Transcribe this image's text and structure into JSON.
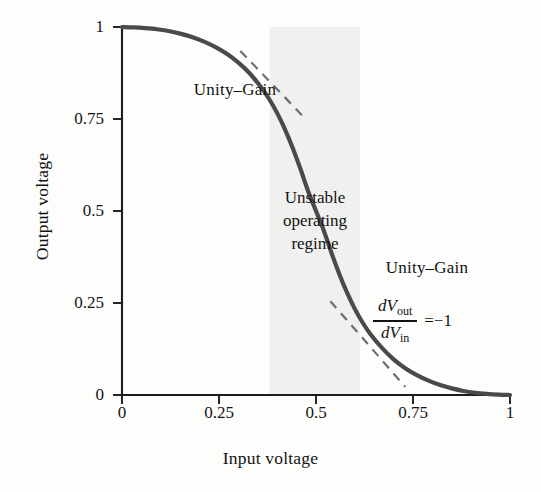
{
  "chart_data": {
    "type": "line",
    "title": "",
    "xlabel": "Input voltage",
    "ylabel": "Output voltage",
    "xlim": [
      0,
      1
    ],
    "ylim": [
      0,
      1
    ],
    "grid": false,
    "legend": "none",
    "xticks": [
      "0",
      "0.25",
      "0.5",
      "0.75",
      "1"
    ],
    "xtick_values": [
      0,
      0.25,
      0.5,
      0.75,
      1
    ],
    "yticks": [
      "0",
      "0.25",
      "0.5",
      "0.75",
      "1"
    ],
    "ytick_values": [
      0,
      0.25,
      0.5,
      0.75,
      1
    ],
    "series": [
      {
        "name": "Voltage transfer characteristic",
        "style": "solid",
        "color": "#4a4a4a",
        "x": [
          0.0,
          0.03,
          0.06,
          0.09,
          0.12,
          0.15,
          0.18,
          0.21,
          0.24,
          0.27,
          0.3,
          0.33,
          0.36,
          0.38,
          0.4,
          0.42,
          0.44,
          0.46,
          0.48,
          0.5,
          0.52,
          0.54,
          0.56,
          0.58,
          0.6,
          0.62,
          0.64,
          0.67,
          0.7,
          0.73,
          0.76,
          0.79,
          0.82,
          0.85,
          0.88,
          0.91,
          0.94,
          0.97,
          1.0
        ],
        "y": [
          1.0,
          0.999,
          0.997,
          0.994,
          0.989,
          0.982,
          0.973,
          0.961,
          0.946,
          0.927,
          0.903,
          0.873,
          0.834,
          0.803,
          0.766,
          0.722,
          0.671,
          0.614,
          0.553,
          0.5,
          0.447,
          0.386,
          0.329,
          0.278,
          0.234,
          0.197,
          0.166,
          0.128,
          0.097,
          0.073,
          0.054,
          0.039,
          0.027,
          0.018,
          0.011,
          0.006,
          0.003,
          0.001,
          0.0
        ]
      },
      {
        "name": "Unity-gain tangent (upper)",
        "style": "dashed",
        "color": "#6e6e6e",
        "x": [
          0.305,
          0.475
        ],
        "y": [
          0.935,
          0.748
        ]
      },
      {
        "name": "Unity-gain tangent (lower)",
        "style": "dashed",
        "color": "#6e6e6e",
        "x": [
          0.537,
          0.73
        ],
        "y": [
          0.255,
          0.022
        ]
      }
    ],
    "shaded_regions": [
      {
        "name": "Unstable operating regime",
        "orientation": "vertical",
        "x_start": 0.381,
        "x_end": 0.613,
        "color": "#f0f0ee"
      }
    ],
    "annotations": [
      {
        "id": "unity-gain-upper",
        "text": "Unity–Gain",
        "x": 0.29,
        "y": 0.835
      },
      {
        "id": "unstable-regime",
        "text": "Unstable operating regime",
        "lines": [
          "Unstable",
          "operating",
          "regime"
        ],
        "x": 0.497,
        "y": 0.525
      },
      {
        "id": "unity-gain-lower",
        "text": "Unity–Gain",
        "x": 0.787,
        "y": 0.313
      },
      {
        "id": "slope-formula",
        "text": "dVout / dVin = −1",
        "numerator": "dV",
        "numerator_sub": "out",
        "denominator": "dV",
        "denominator_sub": "in",
        "rhs": "=−1",
        "x": 0.74,
        "y": 0.21
      }
    ]
  },
  "axes": {
    "x_title": "Input voltage",
    "y_title": "Output voltage",
    "x_tick_labels": [
      "0",
      "0.25",
      "0.5",
      "0.75",
      "1"
    ],
    "y_tick_labels": [
      "0",
      "0.25",
      "0.5",
      "0.75",
      "1"
    ]
  },
  "labels": {
    "unity_gain_upper": "Unity–Gain",
    "unity_gain_lower": "Unity–Gain",
    "unstable_line1": "Unstable",
    "unstable_line2": "operating",
    "unstable_line3": "regime",
    "formula_numerator": "dV",
    "formula_numerator_sub": "out",
    "formula_denominator": "dV",
    "formula_denominator_sub": "in",
    "formula_rhs": "=−1"
  },
  "colors": {
    "curve": "#4a4a4a",
    "tangent": "#6e6e6e",
    "axis": "#1c1c1c",
    "shade": "#f0f0ee",
    "text": "#131313",
    "background": "#fdfdfc"
  }
}
